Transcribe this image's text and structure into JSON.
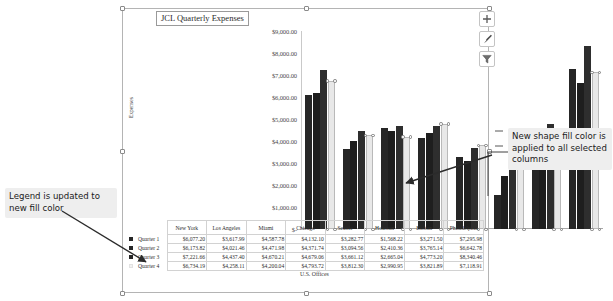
{
  "chart": {
    "title": "JCL Quarterly Expenses",
    "x_axis_title": "U.S. Offices",
    "y_axis_title": "Expenses",
    "y_ticks": [
      "$9,000.00",
      "$8,000.00",
      "$7,000.00",
      "$6,000.00",
      "$5,000.00",
      "$4,000.00",
      "$3,000.00",
      "$2,000.00",
      "$1,000.00",
      "$-"
    ]
  },
  "chart_data": {
    "type": "bar",
    "title": "JCL Quarterly Expenses",
    "xlabel": "U.S. Offices",
    "ylabel": "Expenses",
    "ylim": [
      0,
      9000
    ],
    "grid": false,
    "legend": "data-table",
    "categories": [
      "New York",
      "Los Angeles",
      "Miami",
      "Chicago",
      "Seattle",
      "Houston",
      "Boston",
      "Philadelphia"
    ],
    "series": [
      {
        "name": "Quarter 1",
        "color": "#262626",
        "values": [
          6077.2,
          3617.99,
          4587.78,
          4132.1,
          3282.77,
          1568.22,
          3271.5,
          7295.98
        ],
        "labels": [
          "$6,077.20",
          "$3,617.99",
          "$4,587.78",
          "$4,132.10",
          "$3,282.77",
          "$1,568.22",
          "$3,271.50",
          "$7,295.98"
        ]
      },
      {
        "name": "Quarter 2",
        "color": "#1e1e1e",
        "values": [
          6173.82,
          4021.46,
          4471.98,
          4371.74,
          3094.56,
          2410.36,
          3765.14,
          6642.78
        ],
        "labels": [
          "$6,173.82",
          "$4,021.46",
          "$4,471.98",
          "$4,371.74",
          "$3,094.56",
          "$2,410.36",
          "$3,765.14",
          "$6,642.78"
        ]
      },
      {
        "name": "Quarter 3",
        "color": "#2e2e2e",
        "values": [
          7221.66,
          4437.4,
          4670.21,
          4679.06,
          3661.12,
          2665.04,
          4773.2,
          8340.46
        ],
        "labels": [
          "$7,221.66",
          "$4,437.40",
          "$4,670.21",
          "$4,679.06",
          "$3,661.12",
          "$2,665.04",
          "$4,773.20",
          "$8,340.46"
        ]
      },
      {
        "name": "Quarter 4",
        "color": "#e8e8e8",
        "selected": true,
        "values": [
          6734.19,
          4258.11,
          4200.04,
          4793.72,
          3812.3,
          2990.95,
          3821.89,
          7118.91
        ],
        "labels": [
          "$6,734.19",
          "$4,258.11",
          "$4,200.04",
          "$4,793.72",
          "$3,812.30",
          "$2,990.95",
          "$3,821.89",
          "$7,118.91"
        ]
      }
    ]
  },
  "buttons": {
    "chart_elements": "chart-elements-plus-icon",
    "chart_styles": "chart-styles-brush-icon",
    "chart_filters": "chart-filters-funnel-icon"
  },
  "callouts": {
    "legend": "Legend is updated to new fill color",
    "fill": "New shape fill color is applied to all selected columns"
  }
}
